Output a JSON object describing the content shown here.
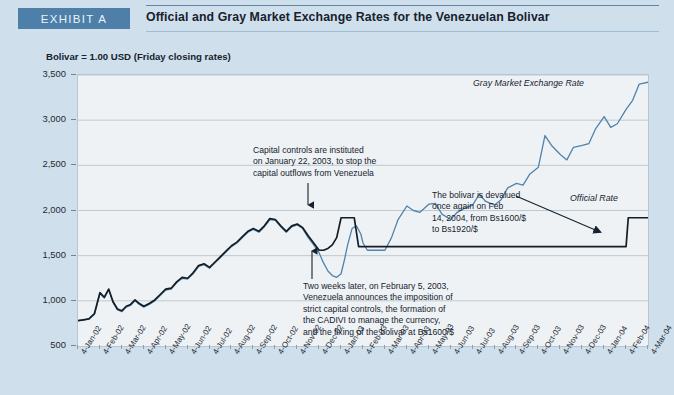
{
  "header": {
    "exhibit_tag": "EXHIBIT A",
    "title": "Official and Gray Market Exchange Rates for the Venezuelan Bolivar"
  },
  "subtitle": "Bolivar = 1.00 USD (Friday closing rates)",
  "series_labels": {
    "gray_market": "Gray Market Exchange Rate",
    "official": "Official Rate"
  },
  "annotations": {
    "capital_controls": "Capital controls are instituted\non January 22, 2003, to stop the\ncapital outflows from Venezuela",
    "two_weeks_later": "Two weeks later, on February 5, 2003,\nVenezuela announces the imposition of\nstrict capital controls, the formation of\nthe CADIVI to manage the currency,\nand the fixing of the bolivar at Bs1600/$",
    "devalued": "The bolivar is devalued\nonce again on Feb\n14, 2004, from Bs1600/$\nto Bs1920/$"
  },
  "colors": {
    "tag_background": "#4e7fa8",
    "page_background": "#cfe0ec",
    "plot_background": "#eef2f5",
    "gray_market_line": "#4f83ad",
    "official_line": "#151d24",
    "gridline": "#b9c4cc"
  },
  "chart_data": {
    "type": "line",
    "title": "Official and Gray Market Exchange Rates for the Venezuelan Bolivar",
    "subtitle": "Bolivar = 1.00 USD (Friday closing rates)",
    "xlabel": "",
    "ylabel": "",
    "ylim": [
      500,
      3500
    ],
    "yticks": [
      500,
      1000,
      1500,
      2000,
      2500,
      3000,
      3500
    ],
    "ytick_labels": [
      "500",
      "1,000",
      "1,500",
      "2,000",
      "2,500",
      "3,000",
      "3,500"
    ],
    "grid": true,
    "legend_position": "inline-annotation",
    "xtick_labels": [
      "4-Jan-02",
      "4-Feb-02",
      "4-Mar-02",
      "4-Apr-02",
      "4-May-02",
      "4-Jun-02",
      "4-Jul-02",
      "4-Aug-02",
      "4-Sep-02",
      "4-Oct-02",
      "4-Nov-02",
      "4-Dec-02",
      "4-Jan-03",
      "4-Feb-03",
      "4-Mar-03",
      "4-Apr-03",
      "4-May-03",
      "4-Jun-03",
      "4-Jul-03",
      "4-Aug-03",
      "4-Sep-03",
      "4-Oct-03",
      "4-Nov-03",
      "4-Dec-03",
      "4-Jan-04",
      "4-Feb-04",
      "4-Mar-04"
    ],
    "series": [
      {
        "name": "Gray Market Exchange Rate",
        "color": "#4f83ad",
        "x": [
          0,
          0.25,
          0.5,
          0.75,
          1,
          1.2,
          1.4,
          1.6,
          1.8,
          2,
          2.2,
          2.4,
          2.6,
          2.8,
          3,
          3.25,
          3.5,
          3.75,
          4,
          4.25,
          4.5,
          4.75,
          5,
          5.25,
          5.5,
          5.75,
          6,
          6.25,
          6.5,
          6.75,
          7,
          7.25,
          7.5,
          7.75,
          8,
          8.25,
          8.5,
          8.75,
          9,
          9.25,
          9.5,
          9.75,
          10,
          10.25,
          10.5,
          10.75,
          11,
          11.2,
          11.4,
          11.6,
          11.8,
          12,
          12.15,
          12.3,
          12.5,
          12.7,
          12.9,
          13,
          13.2,
          13.4,
          13.6,
          13.8,
          14,
          14.3,
          14.6,
          15,
          15.3,
          15.6,
          16,
          16.3,
          16.6,
          17,
          17.3,
          17.6,
          18,
          18.3,
          18.6,
          19,
          19.3,
          19.6,
          20,
          20.3,
          20.6,
          21,
          21.3,
          21.6,
          22,
          22.3,
          22.6,
          23,
          23.3,
          23.6,
          24,
          24.3,
          24.6,
          25,
          25.3,
          25.6,
          26
        ],
        "values": [
          780,
          790,
          800,
          850,
          1080,
          1030,
          1120,
          980,
          900,
          880,
          930,
          950,
          1000,
          960,
          930,
          960,
          1000,
          1060,
          1120,
          1130,
          1200,
          1250,
          1240,
          1300,
          1380,
          1400,
          1360,
          1420,
          1480,
          1540,
          1600,
          1640,
          1700,
          1760,
          1790,
          1760,
          1820,
          1900,
          1890,
          1820,
          1760,
          1820,
          1840,
          1800,
          1700,
          1620,
          1530,
          1420,
          1330,
          1280,
          1260,
          1300,
          1450,
          1620,
          1800,
          1830,
          1740,
          1640,
          1560,
          1560,
          1560,
          1560,
          1560,
          1700,
          1900,
          2050,
          2000,
          1980,
          2070,
          2080,
          1960,
          1900,
          1980,
          2020,
          2060,
          2180,
          2100,
          2060,
          2120,
          2250,
          2300,
          2280,
          2400,
          2480,
          2830,
          2720,
          2620,
          2560,
          2700,
          2720,
          2740,
          2900,
          3040,
          2920,
          2960,
          3120,
          3220,
          3400,
          3420
        ]
      },
      {
        "name": "Official Rate",
        "color": "#151d24",
        "x": [
          0,
          0.25,
          0.5,
          0.75,
          1,
          1.2,
          1.4,
          1.6,
          1.8,
          2,
          2.2,
          2.4,
          2.6,
          2.8,
          3,
          3.25,
          3.5,
          3.75,
          4,
          4.25,
          4.5,
          4.75,
          5,
          5.25,
          5.5,
          5.75,
          6,
          6.25,
          6.5,
          6.75,
          7,
          7.25,
          7.5,
          7.75,
          8,
          8.25,
          8.5,
          8.75,
          9,
          9.25,
          9.5,
          9.75,
          10,
          10.25,
          10.5,
          10.75,
          11,
          11.2,
          11.4,
          11.6,
          11.8,
          12,
          12.2,
          12.4,
          12.6,
          12.8,
          13,
          13.2,
          13.4,
          25,
          25.1,
          25.3,
          26
        ],
        "values": [
          780,
          790,
          800,
          860,
          1090,
          1040,
          1130,
          990,
          910,
          890,
          940,
          960,
          1010,
          970,
          940,
          970,
          1010,
          1070,
          1130,
          1140,
          1210,
          1260,
          1250,
          1310,
          1390,
          1410,
          1370,
          1430,
          1490,
          1550,
          1610,
          1650,
          1710,
          1770,
          1800,
          1770,
          1830,
          1910,
          1900,
          1830,
          1770,
          1830,
          1850,
          1810,
          1720,
          1640,
          1560,
          1560,
          1580,
          1620,
          1700,
          1920,
          1920,
          1920,
          1920,
          1600,
          1600,
          1600,
          1600,
          1600,
          1920,
          1920,
          1920
        ]
      }
    ],
    "events": [
      {
        "date": "22-Jan-2003",
        "label": "Capital controls instituted",
        "value": 1920
      },
      {
        "date": "5-Feb-2003",
        "label": "Bolivar fixed at Bs1600/$",
        "value": 1600
      },
      {
        "date": "14-Feb-2004",
        "label": "Bolivar devalued to Bs1920/$",
        "value": 1920
      }
    ]
  }
}
